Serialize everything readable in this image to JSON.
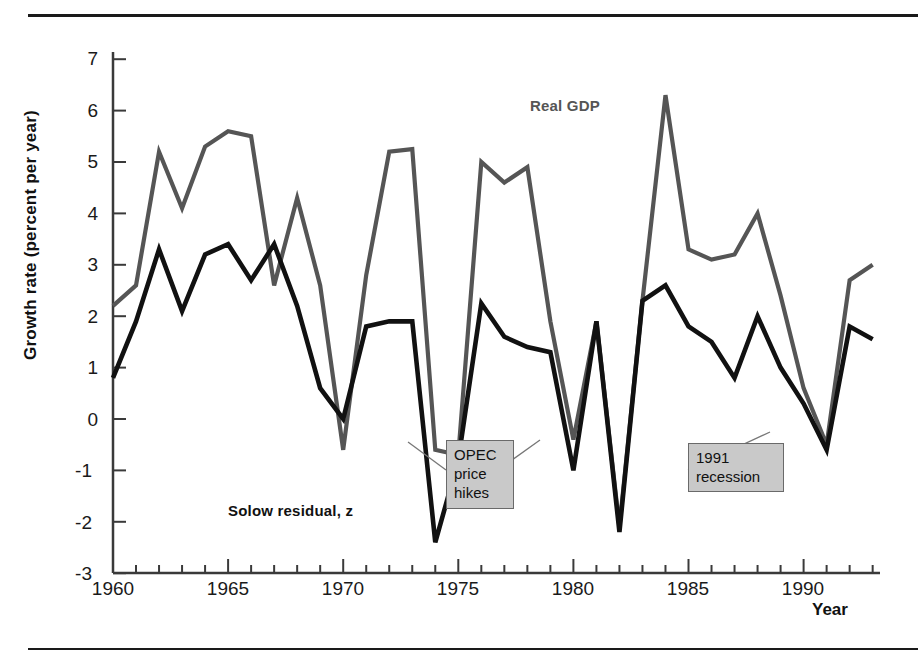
{
  "figure": {
    "ylabel": "Growth rate (percent per year)",
    "xlabel": "Year"
  },
  "labels": {
    "real_gdp": "Real GDP",
    "solow": "Solow residual, z"
  },
  "callouts": {
    "opec": "OPEC price hikes",
    "opec_lines": [
      "OPEC",
      "price",
      "hikes"
    ],
    "recession": "1991 recession",
    "recession_lines": [
      "1991",
      "recession"
    ]
  },
  "colors": {
    "real_gdp": "#555555",
    "solow": "#111111",
    "callout_bg": "#c9c9c9",
    "callout_border": "#6a6a6a",
    "axis": "#3a3a3a"
  },
  "axis": {
    "y_ticks": [
      "7",
      "6",
      "5",
      "4",
      "3",
      "2",
      "1",
      "0",
      "-1",
      "-2",
      "-3"
    ],
    "x_ticks": [
      "1960",
      "1965",
      "1970",
      "1975",
      "1980",
      "1985",
      "1990"
    ]
  },
  "chart_data": {
    "type": "line",
    "title": "",
    "xlabel": "Year",
    "ylabel": "Growth rate (percent per year)",
    "xlim": [
      1960,
      1993
    ],
    "ylim": [
      -3,
      7
    ],
    "grid": false,
    "legend": "inline-annotations",
    "x": [
      1960,
      1961,
      1962,
      1963,
      1964,
      1965,
      1966,
      1967,
      1968,
      1969,
      1970,
      1971,
      1972,
      1973,
      1974,
      1975,
      1976,
      1977,
      1978,
      1979,
      1980,
      1981,
      1982,
      1983,
      1984,
      1985,
      1986,
      1987,
      1988,
      1989,
      1990,
      1991,
      1992,
      1993
    ],
    "series": [
      {
        "name": "Real GDP",
        "color": "#555555",
        "values": [
          2.2,
          2.6,
          5.2,
          4.1,
          5.3,
          5.6,
          5.5,
          2.6,
          4.3,
          2.6,
          -0.6,
          2.8,
          5.2,
          5.25,
          -0.6,
          -0.7,
          5.0,
          4.6,
          4.9,
          1.9,
          -0.4,
          1.9,
          -2.1,
          2.3,
          6.3,
          3.3,
          3.1,
          3.2,
          4.0,
          2.4,
          0.6,
          -0.5,
          2.7,
          3.0
        ]
      },
      {
        "name": "Solow residual, z",
        "color": "#111111",
        "values": [
          0.8,
          1.9,
          3.3,
          2.1,
          3.2,
          3.4,
          2.7,
          3.4,
          2.2,
          0.6,
          0.0,
          1.8,
          1.9,
          1.9,
          -2.4,
          -0.8,
          2.25,
          1.6,
          1.4,
          1.3,
          -1.0,
          1.9,
          -2.2,
          2.3,
          2.6,
          1.8,
          1.5,
          0.8,
          2.0,
          1.0,
          0.3,
          -0.6,
          1.8,
          1.55
        ]
      }
    ],
    "annotations": [
      {
        "text": "Real GDP",
        "x": 1978,
        "y": 5.9
      },
      {
        "text": "Solow residual, z",
        "x": 1966,
        "y": -1.9
      },
      {
        "text": "OPEC price hikes",
        "points": [
          1974,
          1976
        ]
      },
      {
        "text": "1991 recession",
        "points": [
          1991
        ]
      }
    ]
  }
}
